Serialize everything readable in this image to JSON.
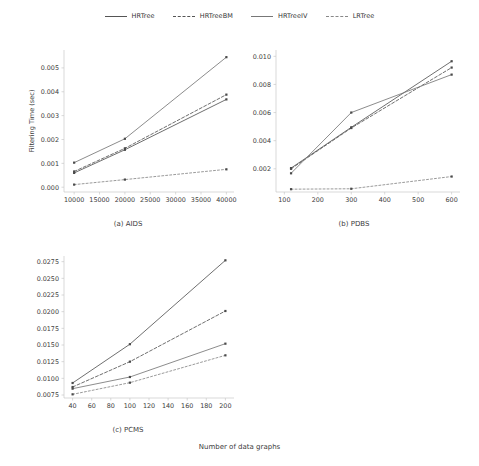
{
  "legend": {
    "position": "top-center",
    "entries": [
      {
        "label": "HRTree",
        "style": "solid",
        "color": "#555555",
        "dash": "none"
      },
      {
        "label": "HRTreeBM",
        "style": "dashed",
        "color": "#555555",
        "dash": "3,2"
      },
      {
        "label": "HRTreeIV",
        "style": "solid",
        "color": "#777777",
        "dash": "none"
      },
      {
        "label": "LRTree",
        "style": "dash-dot",
        "color": "#888888",
        "dash": "2,2"
      }
    ]
  },
  "figure": {
    "xlabel": "Number of data graphs",
    "ylabel": "Filtering Time (sec)"
  },
  "chart_data": [
    {
      "id": "aids",
      "type": "line",
      "title": "(a) AIDS",
      "xlabel": "",
      "ylabel": "Filtering Time (sec)",
      "x": [
        10000,
        20000,
        40000
      ],
      "xticks": [
        10000,
        15000,
        20000,
        25000,
        30000,
        35000,
        40000
      ],
      "xticklabels": [
        "10000",
        "15000",
        "20000",
        "25000",
        "30000",
        "35000",
        "40000"
      ],
      "xlim": [
        8000,
        41500
      ],
      "yticks": [
        0.0,
        0.001,
        0.002,
        0.003,
        0.004,
        0.005
      ],
      "yticklabels": [
        "0.000",
        "0.001",
        "0.002",
        "0.003",
        "0.004",
        "0.005"
      ],
      "ylim": [
        -0.0002,
        0.00575
      ],
      "grid": false,
      "series": [
        {
          "name": "HRTree",
          "values": [
            0.0006,
            0.00157,
            0.00368
          ]
        },
        {
          "name": "HRTreeBM",
          "values": [
            0.00066,
            0.00163,
            0.00388
          ]
        },
        {
          "name": "HRTreeIV",
          "values": [
            0.00103,
            0.00203,
            0.00545
          ]
        },
        {
          "name": "LRTree",
          "values": [
            0.00011,
            0.00032,
            0.00075
          ]
        }
      ]
    },
    {
      "id": "pdbs",
      "type": "line",
      "title": "(b) PDBS",
      "xlabel": "",
      "ylabel": "",
      "x": [
        120,
        300,
        600
      ],
      "xticks": [
        100,
        200,
        300,
        400,
        500,
        600
      ],
      "xticklabels": [
        "100",
        "200",
        "300",
        "400",
        "500",
        "600"
      ],
      "xlim": [
        75,
        625
      ],
      "yticks": [
        0.002,
        0.004,
        0.006,
        0.008,
        0.01
      ],
      "yticklabels": [
        "0.002",
        "0.004",
        "0.006",
        "0.008",
        "0.010"
      ],
      "ylim": [
        0.00035,
        0.01045
      ],
      "grid": false,
      "series": [
        {
          "name": "HRTree",
          "values": [
            0.00205,
            0.00495,
            0.00965
          ]
        },
        {
          "name": "HRTreeBM",
          "values": [
            0.002,
            0.0049,
            0.0092
          ]
        },
        {
          "name": "HRTreeIV",
          "values": [
            0.00168,
            0.006,
            0.0087
          ]
        },
        {
          "name": "LRTree",
          "values": [
            0.00055,
            0.00058,
            0.00145
          ]
        }
      ]
    },
    {
      "id": "pcms",
      "type": "line",
      "title": "(c) PCMS",
      "xlabel": "",
      "ylabel": "",
      "x": [
        40,
        100,
        200
      ],
      "xticks": [
        40,
        60,
        80,
        100,
        120,
        140,
        160,
        180,
        200
      ],
      "xticklabels": [
        "40",
        "60",
        "80",
        "100",
        "120",
        "140",
        "160",
        "180",
        "200"
      ],
      "xlim": [
        31,
        209
      ],
      "yticks": [
        0.0075,
        0.01,
        0.0125,
        0.015,
        0.0175,
        0.02,
        0.0225,
        0.025,
        0.0275
      ],
      "yticklabels": [
        "0.0075",
        "0.0100",
        "0.0125",
        "0.0150",
        "0.0175",
        "0.0200",
        "0.0225",
        "0.0250",
        "0.0275"
      ],
      "ylim": [
        0.00705,
        0.02835
      ],
      "grid": false,
      "series": [
        {
          "name": "HRTree",
          "values": [
            0.0093,
            0.01512,
            0.0277
          ]
        },
        {
          "name": "HRTreeBM",
          "values": [
            0.0087,
            0.0125,
            0.0201
          ]
        },
        {
          "name": "HRTreeIV",
          "values": [
            0.00845,
            0.0102,
            0.0152
          ]
        },
        {
          "name": "LRTree",
          "values": [
            0.0076,
            0.00935,
            0.01345
          ]
        }
      ]
    }
  ]
}
